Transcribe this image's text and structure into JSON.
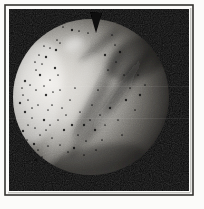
{
  "canvas": {
    "width": 204,
    "height": 209
  },
  "page": {
    "background": "#fbfbf9"
  },
  "frame": {
    "rule_color": "#34332f",
    "rule": {
      "x": 5,
      "y": 5,
      "w": 188,
      "h": 190,
      "stroke": 1.6
    },
    "inner_line_color": "#9a9a96",
    "inner_lines": [
      {
        "x1": 190.8,
        "y1": 8,
        "x2": 190.8,
        "y2": 192.5
      },
      {
        "x1": 8,
        "y1": 192.8,
        "x2": 190,
        "y2": 192.8
      }
    ]
  },
  "photo": {
    "x": 9,
    "y": 9,
    "w": 180,
    "h": 182,
    "background": "#070707",
    "subject": "planet-disk-photo"
  },
  "planet": {
    "cx": 91,
    "cy": 97,
    "r": 78,
    "gradient": {
      "cx": 0.45,
      "cy": 0.48,
      "r": 0.75,
      "fx": 0.22,
      "fy": 0.4,
      "stops": [
        {
          "o": 0.0,
          "c": "#ece9e4"
        },
        {
          "o": 0.3,
          "c": "#c6c4bf"
        },
        {
          "o": 0.5,
          "c": "#93918c"
        },
        {
          "o": 0.68,
          "c": "#55534f"
        },
        {
          "o": 0.84,
          "c": "#1d1c1b"
        },
        {
          "o": 1.0,
          "c": "#070707"
        }
      ]
    },
    "notch_points": "90,12 96,33 102,13",
    "streaks": [
      {
        "cx": 36,
        "cy": 92,
        "rx": 26,
        "ry": 52,
        "rot": 8,
        "fill": "#ffffff",
        "op": 0.35
      },
      {
        "cx": 74,
        "cy": 44,
        "rx": 10,
        "ry": 7,
        "rot": -20,
        "fill": "#ffffff",
        "op": 0.45
      },
      {
        "cx": 72,
        "cy": 100,
        "rx": 48,
        "ry": 8,
        "rot": -62,
        "fill": "#ffffff",
        "op": 0.1
      },
      {
        "cx": 98,
        "cy": 92,
        "rx": 52,
        "ry": 6,
        "rot": -60,
        "fill": "#000000",
        "op": 0.3
      },
      {
        "cx": 110,
        "cy": 104,
        "rx": 48,
        "ry": 5,
        "rot": -58,
        "fill": "#000000",
        "op": 0.28
      },
      {
        "cx": 120,
        "cy": 92,
        "rx": 42,
        "ry": 4,
        "rot": -57,
        "fill": "#ffffff",
        "op": 0.1
      },
      {
        "cx": 128,
        "cy": 82,
        "rx": 40,
        "ry": 6,
        "rot": -55,
        "fill": "#000000",
        "op": 0.3
      },
      {
        "cx": 90,
        "cy": 120,
        "rx": 44,
        "ry": 6,
        "rot": -62,
        "fill": "#000000",
        "op": 0.25
      },
      {
        "cx": 138,
        "cy": 58,
        "rx": 34,
        "ry": 20,
        "rot": -25,
        "fill": "#000000",
        "op": 0.35
      },
      {
        "cx": 95,
        "cy": 160,
        "rx": 50,
        "ry": 14,
        "rot": -10,
        "fill": "#000000",
        "op": 0.3
      },
      {
        "cx": 58,
        "cy": 135,
        "rx": 35,
        "ry": 7,
        "rot": -65,
        "fill": "#ffffff",
        "op": 0.08
      },
      {
        "cx": 100,
        "cy": 45,
        "rx": 26,
        "ry": 5,
        "rot": -40,
        "fill": "#000000",
        "op": 0.3
      }
    ],
    "speckle_color": "#0d0d0d",
    "speckles": [
      [
        25,
        81
      ],
      [
        30,
        85
      ],
      [
        23,
        95
      ],
      [
        28,
        100
      ],
      [
        25,
        112
      ],
      [
        32,
        118
      ],
      [
        28,
        125
      ],
      [
        35,
        128
      ],
      [
        23,
        131
      ],
      [
        36,
        90
      ],
      [
        38,
        105
      ],
      [
        27,
        140
      ],
      [
        34,
        144
      ],
      [
        30,
        152
      ],
      [
        38,
        150
      ],
      [
        42,
        157
      ],
      [
        36,
        160
      ],
      [
        45,
        163
      ],
      [
        40,
        135
      ],
      [
        46,
        130
      ],
      [
        44,
        120
      ],
      [
        50,
        125
      ],
      [
        48,
        110
      ],
      [
        52,
        105
      ],
      [
        46,
        95
      ],
      [
        53,
        92
      ],
      [
        44,
        86
      ],
      [
        50,
        80
      ],
      [
        40,
        75
      ],
      [
        36,
        70
      ],
      [
        42,
        64
      ],
      [
        35,
        62
      ],
      [
        46,
        57
      ],
      [
        39,
        55
      ],
      [
        50,
        48
      ],
      [
        44,
        46
      ],
      [
        56,
        50
      ],
      [
        57,
        40
      ],
      [
        60,
        43
      ],
      [
        63,
        27
      ],
      [
        72,
        30
      ],
      [
        79,
        31
      ],
      [
        88,
        33
      ],
      [
        58,
        75
      ],
      [
        55,
        68
      ],
      [
        60,
        90
      ],
      [
        62,
        108
      ],
      [
        58,
        120
      ],
      [
        64,
        130
      ],
      [
        60,
        145
      ],
      [
        68,
        152
      ],
      [
        66,
        115
      ],
      [
        72,
        125
      ],
      [
        70,
        100
      ],
      [
        75,
        88
      ],
      [
        80,
        112
      ],
      [
        84,
        125
      ],
      [
        78,
        135
      ],
      [
        86,
        141
      ],
      [
        90,
        120
      ],
      [
        95,
        130
      ],
      [
        92,
        105
      ],
      [
        100,
        115
      ],
      [
        105,
        125
      ],
      [
        110,
        108
      ],
      [
        98,
        90
      ],
      [
        108,
        70
      ],
      [
        115,
        45
      ],
      [
        120,
        52
      ],
      [
        116,
        62
      ],
      [
        124,
        75
      ],
      [
        130,
        88
      ],
      [
        126,
        100
      ],
      [
        118,
        120
      ],
      [
        122,
        135
      ],
      [
        135,
        110
      ],
      [
        140,
        95
      ],
      [
        138,
        75
      ],
      [
        145,
        85
      ],
      [
        112,
        35
      ],
      [
        105,
        55
      ],
      [
        102,
        140
      ],
      [
        96,
        150
      ],
      [
        84,
        155
      ],
      [
        74,
        148
      ],
      [
        52,
        138
      ],
      [
        48,
        146
      ],
      [
        32,
        108
      ],
      [
        20,
        103
      ],
      [
        22,
        88
      ]
    ],
    "scanline_color": "#ffffff",
    "scanlines": [
      86.5,
      118.5
    ]
  }
}
